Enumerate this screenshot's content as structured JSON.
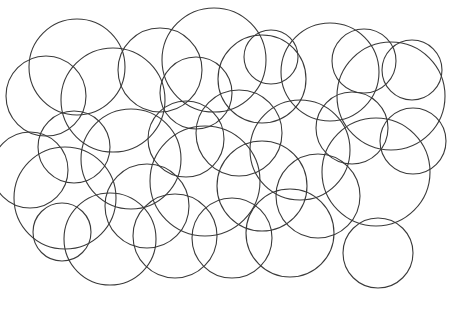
{
  "page": {
    "background_color": "#ffffff",
    "width": 449,
    "height": 322
  },
  "footer": {
    "page_number": "3",
    "page_word": "three",
    "label_color": "#cfcfcf",
    "rule_color": "#a8a8a8"
  },
  "answer": {
    "label": "答案:",
    "value": "32",
    "color": "#1a1a1a"
  },
  "puzzle": {
    "shape": "circle",
    "count": 32,
    "stroke_color": "#3a3a3a",
    "stroke_width": 1.1,
    "fill": "none",
    "circles": [
      {
        "cx": 77,
        "cy": 67,
        "r": 48
      },
      {
        "cx": 46,
        "cy": 96,
        "r": 40
      },
      {
        "cx": 113,
        "cy": 100,
        "r": 52
      },
      {
        "cx": 160,
        "cy": 70,
        "r": 42
      },
      {
        "cx": 214,
        "cy": 60,
        "r": 52
      },
      {
        "cx": 196,
        "cy": 93,
        "r": 36
      },
      {
        "cx": 262,
        "cy": 79,
        "r": 44
      },
      {
        "cx": 271,
        "cy": 57,
        "r": 27
      },
      {
        "cx": 330,
        "cy": 72,
        "r": 49
      },
      {
        "cx": 364,
        "cy": 61,
        "r": 32
      },
      {
        "cx": 391,
        "cy": 96,
        "r": 54
      },
      {
        "cx": 412,
        "cy": 70,
        "r": 30
      },
      {
        "cx": 30,
        "cy": 170,
        "r": 38
      },
      {
        "cx": 74,
        "cy": 147,
        "r": 36
      },
      {
        "cx": 65,
        "cy": 198,
        "r": 51
      },
      {
        "cx": 131,
        "cy": 159,
        "r": 50
      },
      {
        "cx": 147,
        "cy": 206,
        "r": 42
      },
      {
        "cx": 186,
        "cy": 139,
        "r": 38
      },
      {
        "cx": 205,
        "cy": 181,
        "r": 55
      },
      {
        "cx": 239,
        "cy": 133,
        "r": 43
      },
      {
        "cx": 262,
        "cy": 186,
        "r": 45
      },
      {
        "cx": 300,
        "cy": 150,
        "r": 50
      },
      {
        "cx": 318,
        "cy": 196,
        "r": 42
      },
      {
        "cx": 352,
        "cy": 128,
        "r": 36
      },
      {
        "cx": 376,
        "cy": 172,
        "r": 54
      },
      {
        "cx": 413,
        "cy": 141,
        "r": 33
      },
      {
        "cx": 62,
        "cy": 232,
        "r": 29
      },
      {
        "cx": 110,
        "cy": 239,
        "r": 46
      },
      {
        "cx": 175,
        "cy": 236,
        "r": 42
      },
      {
        "cx": 232,
        "cy": 238,
        "r": 40
      },
      {
        "cx": 290,
        "cy": 233,
        "r": 44
      },
      {
        "cx": 378,
        "cy": 253,
        "r": 35
      }
    ]
  }
}
